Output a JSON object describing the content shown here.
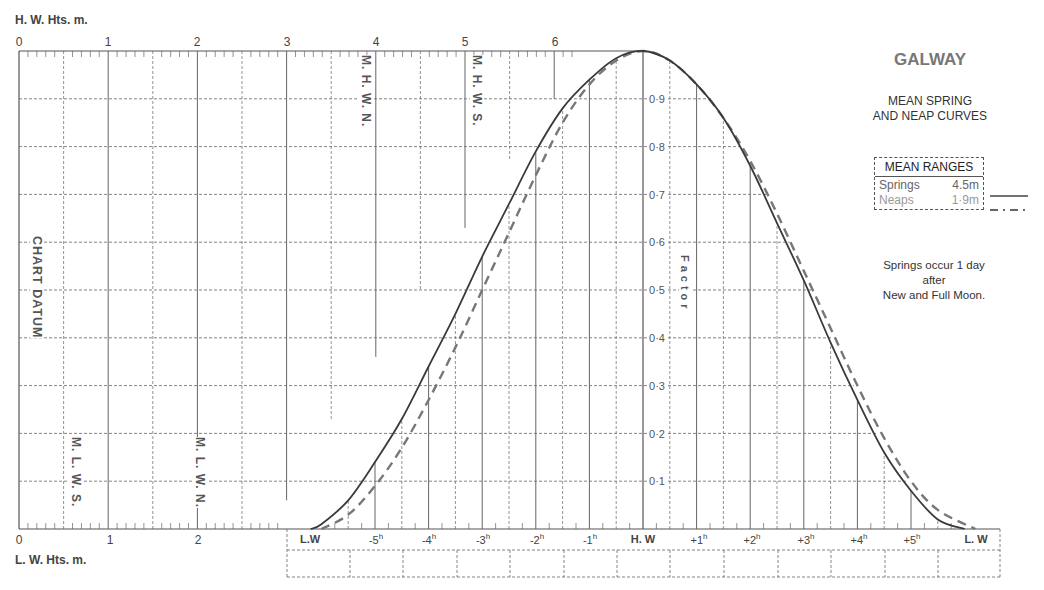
{
  "chart_data": {
    "type": "line",
    "title": "GALWAY",
    "subtitle": "MEAN SPRING AND NEAP CURVES",
    "top_axis_label": "H. W. Hts. m.",
    "bottom_axis_label": "L. W. Hts. m.",
    "top_axis_ticks": [
      "0",
      "1",
      "2",
      "3",
      "4",
      "5",
      "6"
    ],
    "bottom_axis_ticks": [
      "0",
      "1",
      "2"
    ],
    "left_axis_label": "CHART DATUM",
    "factor_label": "Factor",
    "factor_ticks": [
      "0·9",
      "0·8",
      "0·7",
      "0·6",
      "0·5",
      "0·4",
      "0·3",
      "0·2",
      "0·1"
    ],
    "x_categories": [
      "L.W",
      "-5h",
      "-4h",
      "-3h",
      "-2h",
      "-1h",
      "H. W",
      "+1h",
      "+2h",
      "+3h",
      "+4h",
      "+5h",
      "L. W"
    ],
    "x_hours": [
      -6.2,
      -5,
      -4,
      -3,
      -2,
      -1,
      0,
      1,
      2,
      3,
      4,
      5,
      6.0
    ],
    "ylim": [
      0,
      1
    ],
    "series": [
      {
        "name": "Springs",
        "range_m": 4.5,
        "style": "solid",
        "x": [
          -6.2,
          -6,
          -5.5,
          -5,
          -4.5,
          -4,
          -3.5,
          -3,
          -2.5,
          -2,
          -1.5,
          -1,
          -0.5,
          0,
          0.5,
          1,
          1.5,
          2,
          2.5,
          3,
          3.5,
          4,
          4.5,
          5,
          5.5,
          6.0
        ],
        "values": [
          0,
          0.01,
          0.06,
          0.14,
          0.23,
          0.34,
          0.45,
          0.57,
          0.68,
          0.79,
          0.88,
          0.94,
          0.985,
          1.0,
          0.98,
          0.93,
          0.86,
          0.76,
          0.64,
          0.52,
          0.39,
          0.27,
          0.16,
          0.08,
          0.02,
          0
        ]
      },
      {
        "name": "Neaps",
        "range_m": 1.9,
        "style": "dashed",
        "x": [
          -6.0,
          -5.5,
          -5,
          -4.5,
          -4,
          -3.5,
          -3,
          -2.5,
          -2,
          -1.5,
          -1,
          -0.5,
          0,
          0.5,
          1,
          1.5,
          2,
          2.5,
          3,
          3.5,
          4,
          4.5,
          5,
          5.5,
          6.2
        ],
        "values": [
          0,
          0.03,
          0.09,
          0.17,
          0.27,
          0.38,
          0.5,
          0.62,
          0.74,
          0.85,
          0.93,
          0.98,
          1.0,
          0.98,
          0.93,
          0.86,
          0.77,
          0.66,
          0.54,
          0.42,
          0.3,
          0.19,
          0.1,
          0.04,
          0
        ]
      }
    ],
    "reference_marks": {
      "top": [
        {
          "label": "M. H. W. N.",
          "value_m": 4.0
        },
        {
          "label": "M. H. W. S.",
          "value_m": 5.0
        }
      ],
      "bottom": [
        {
          "label": "M. L. W. S.",
          "value_m": 0.6
        },
        {
          "label": "M. L. W. N.",
          "value_m": 2.0
        }
      ]
    },
    "legend": {
      "title": "MEAN RANGES",
      "entries": [
        {
          "label": "Springs",
          "value": "4.5m",
          "style": "solid"
        },
        {
          "label": "Neaps",
          "value": "1·9m",
          "style": "dashed"
        }
      ]
    },
    "note": [
      "Springs occur 1 day",
      "after",
      "New and Full Moon."
    ]
  },
  "labels": {
    "hw_axis": "H. W. Hts. m.",
    "lw_axis": "L. W. Hts. m.",
    "chart_datum": "CHART DATUM",
    "factor": "Factor",
    "mhwn": "M. H. W. N.",
    "mhws": "M. H. W. S.",
    "mlws": "M. L. W. S.",
    "mlwn": "M. L. W. N.",
    "title": "GALWAY",
    "subtitle1": "MEAN SPRING",
    "subtitle2": "AND NEAP CURVES",
    "legend_title": "MEAN RANGES",
    "springs": "Springs",
    "springs_val": "4.5m",
    "neaps": "Neaps",
    "neaps_val": "1·9m",
    "note1": "Springs occur 1 day",
    "note2": "after",
    "note3": "New and Full Moon."
  },
  "colors": {
    "curve": "#3a3a3a",
    "neap": "#777777",
    "grid": "#555555",
    "title": "#777777"
  }
}
